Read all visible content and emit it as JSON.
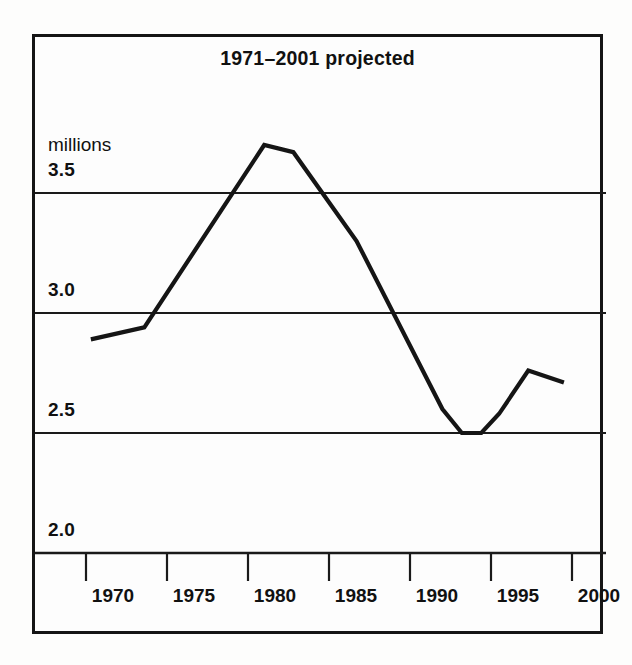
{
  "chart_data": {
    "type": "line",
    "title": "1971–2001 projected",
    "xlabel": "",
    "ylabel": "millions",
    "units_label": "millions",
    "xlim": [
      1969.0,
      2001.5
    ],
    "ylim": [
      1.75,
      3.85
    ],
    "xticks": [
      1970,
      1975,
      1980,
      1985,
      1990,
      1995,
      2000
    ],
    "xtick_labels": [
      "1970",
      "1975",
      "1980",
      "1985",
      "1990",
      "1995",
      "2000"
    ],
    "yticks": [
      2.0,
      2.5,
      3.0,
      3.5
    ],
    "ytick_labels": [
      "2.0",
      "2.5",
      "3.0",
      "3.5"
    ],
    "gridlines_y": [
      2.5,
      3.0,
      3.5
    ],
    "grid": true,
    "legend": null,
    "series": [
      {
        "name": "projected population",
        "x": [
          1970.3,
          1973.6,
          1981.0,
          1982.8,
          1986.7,
          1992.0,
          1993.2,
          1994.4,
          1995.5,
          1997.3,
          1999.5
        ],
        "values": [
          2.89,
          2.94,
          3.7,
          3.67,
          3.3,
          2.6,
          2.5,
          2.5,
          2.58,
          2.76,
          2.71
        ]
      }
    ]
  },
  "figure": {
    "title": "1971–2001 projected",
    "units": "millions",
    "y_axis": {
      "ticks": [
        {
          "label": "3.5",
          "value": 3.5
        },
        {
          "label": "3.0",
          "value": 3.0
        },
        {
          "label": "2.5",
          "value": 2.5
        },
        {
          "label": "2.0",
          "value": 2.0
        }
      ]
    },
    "x_axis": {
      "ticks": [
        {
          "label": "1970",
          "value": 1970
        },
        {
          "label": "1975",
          "value": 1975
        },
        {
          "label": "1980",
          "value": 1980
        },
        {
          "label": "1985",
          "value": 1985
        },
        {
          "label": "1990",
          "value": 1990
        },
        {
          "label": "1995",
          "value": 1995
        },
        {
          "label": "2000",
          "value": 2000
        }
      ]
    },
    "colors": {
      "line": "#151515",
      "grid": "#1a1a1a",
      "frame": "#151515",
      "text": "#111111",
      "background": "#fdfdfd"
    }
  }
}
